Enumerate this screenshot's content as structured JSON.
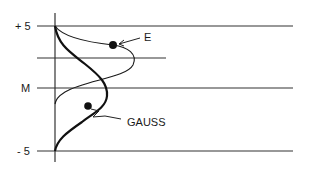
{
  "diagram": {
    "y_axis_labels": {
      "top": "+ 5",
      "middle": "M",
      "bottom": "- 5"
    },
    "curves": [
      {
        "name": "E",
        "label": "E",
        "style": "thin"
      },
      {
        "name": "Gauss",
        "label": "GAUSS",
        "style": "bold"
      }
    ],
    "colors": {
      "line": "#1a1a1a",
      "background": "#ffffff"
    }
  }
}
